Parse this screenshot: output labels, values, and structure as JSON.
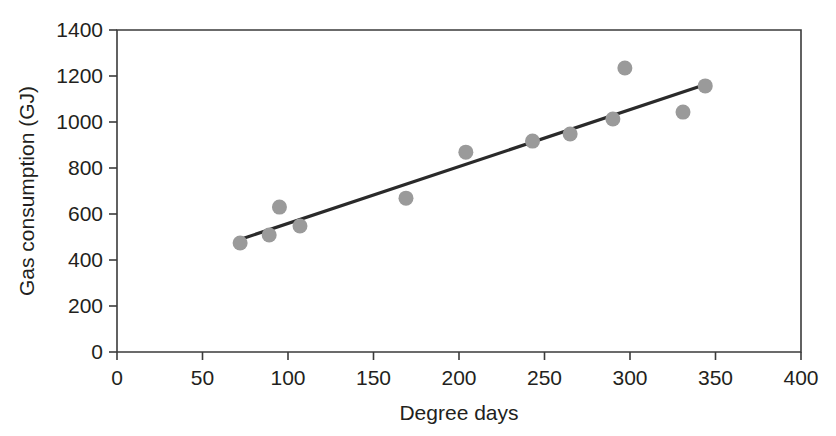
{
  "chart_data": {
    "type": "scatter",
    "title": "",
    "xlabel": "Degree days",
    "ylabel": "Gas consumption (GJ)",
    "xlim": [
      0,
      400
    ],
    "ylim": [
      0,
      1400
    ],
    "xticks": [
      0,
      50,
      100,
      150,
      200,
      250,
      300,
      350,
      400
    ],
    "yticks": [
      0,
      200,
      400,
      600,
      800,
      1000,
      1200,
      1400
    ],
    "xtick_labels": [
      "0",
      "50",
      "100",
      "150",
      "200",
      "250",
      "300",
      "350",
      "400"
    ],
    "ytick_labels": [
      "0",
      "200",
      "400",
      "600",
      "800",
      "1000",
      "1200",
      "1400"
    ],
    "grid": false,
    "legend": null,
    "point_color": "#9a9a9a",
    "line_color": "#2a2a2a",
    "axis_color": "#3b3b3b",
    "series": [
      {
        "name": "Observations",
        "type": "scatter",
        "x": [
          72,
          89,
          95,
          107,
          169,
          204,
          243,
          265,
          290,
          297,
          331,
          344
        ],
        "y": [
          474,
          509,
          630,
          548,
          669,
          869,
          917,
          948,
          1013,
          1235,
          1043,
          1157
        ]
      },
      {
        "name": "Fitted regression line",
        "type": "line",
        "x": [
          71,
          345
        ],
        "y": [
          487,
          1165
        ]
      }
    ],
    "annotations": []
  },
  "axis": {
    "x_title": "Degree days",
    "y_title": "Gas consumption (GJ)"
  }
}
